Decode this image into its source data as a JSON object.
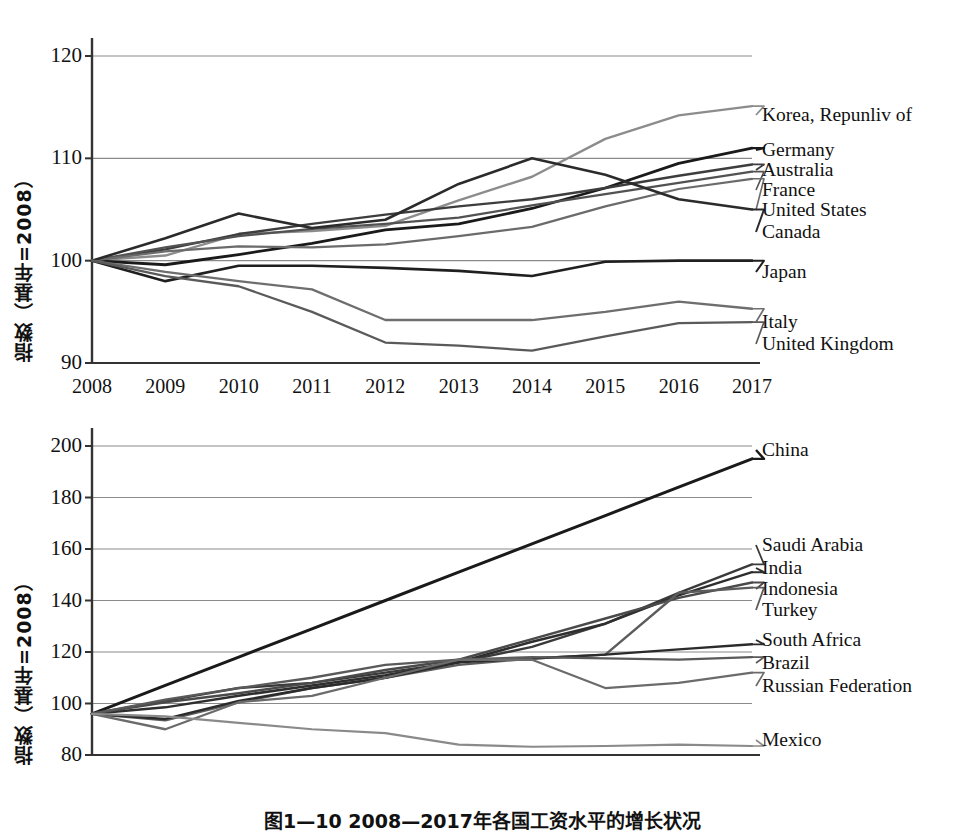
{
  "figure": {
    "caption": "图1—10  2008—2017年各国工资水平的增长状况"
  },
  "chart_data": [
    {
      "id": "advanced-economies",
      "type": "line",
      "title": "",
      "xlabel": "",
      "ylabel": "指数（基年=2008）",
      "x": [
        2008,
        2009,
        2010,
        2011,
        2012,
        2013,
        2014,
        2015,
        2016,
        2017
      ],
      "xlim": [
        2008,
        2017
      ],
      "ylim": [
        90,
        120
      ],
      "yticks": [
        90,
        100,
        110,
        120
      ],
      "xticks": [
        "2008",
        "2009",
        "2010",
        "2011",
        "2012",
        "2013",
        "2014",
        "2015",
        "2016",
        "2017"
      ],
      "grid": true,
      "legend_position": "right",
      "series": [
        {
          "name": "Korea,  Repunliv of",
          "color": "#8c8c8c",
          "width": 2.4,
          "values": [
            100.0,
            100.5,
            102.6,
            102.9,
            103.4,
            105.9,
            108.2,
            111.9,
            114.2,
            115.1
          ]
        },
        {
          "name": "Germany",
          "color": "#1a1a1a",
          "width": 2.8,
          "values": [
            100.0,
            99.6,
            100.6,
            101.7,
            103.0,
            103.6,
            105.1,
            107.1,
            109.5,
            111.0
          ]
        },
        {
          "name": "Australia",
          "color": "#3d3d3d",
          "width": 2.4,
          "values": [
            100.0,
            101.1,
            102.6,
            103.6,
            104.5,
            105.3,
            106.0,
            107.1,
            108.3,
            109.4
          ]
        },
        {
          "name": "France",
          "color": "#525252",
          "width": 2.2,
          "values": [
            100.0,
            101.3,
            102.4,
            103.1,
            103.6,
            104.2,
            105.4,
            106.5,
            107.6,
            108.7
          ]
        },
        {
          "name": "United States",
          "color": "#6b6b6b",
          "width": 2.2,
          "values": [
            100.0,
            100.9,
            101.4,
            101.3,
            101.6,
            102.4,
            103.3,
            105.3,
            107.0,
            108.0
          ]
        },
        {
          "name": "Canada",
          "color": "#2b2b2b",
          "width": 2.6,
          "values": [
            100.0,
            102.2,
            104.6,
            103.2,
            104.0,
            107.5,
            110.0,
            108.4,
            106.0,
            105.0
          ]
        },
        {
          "name": "Japan",
          "color": "#1f1f1f",
          "width": 2.6,
          "values": [
            100.0,
            98.0,
            99.5,
            99.5,
            99.3,
            99.0,
            98.5,
            99.9,
            100.0,
            100.0
          ]
        },
        {
          "name": "Italy",
          "color": "#6e6e6e",
          "width": 2.3,
          "values": [
            100.0,
            98.9,
            98.0,
            97.2,
            94.2,
            94.2,
            94.2,
            95.0,
            96.0,
            95.3
          ]
        },
        {
          "name": "United Kingdom",
          "color": "#5a5a5a",
          "width": 2.3,
          "values": [
            100.0,
            98.5,
            97.5,
            95.0,
            92.0,
            91.7,
            91.2,
            92.6,
            93.9,
            94.0
          ]
        }
      ],
      "legend_entries": [
        {
          "label": "Korea,  Repunliv of",
          "y_value": 115.1
        },
        {
          "label": "Germany",
          "y_value": 111.0
        },
        {
          "label": "Australia",
          "y_value": 109.4
        },
        {
          "label": "France",
          "y_value": 108.7
        },
        {
          "label": "United States",
          "y_value": 108.0
        },
        {
          "label": "Canada",
          "y_value": 105.0
        },
        {
          "label": "Japan",
          "y_value": 100.0
        },
        {
          "label": "Italy",
          "y_value": 95.3
        },
        {
          "label": "United Kingdom",
          "y_value": 94.0
        }
      ]
    },
    {
      "id": "emerging-economies",
      "type": "line",
      "title": "",
      "xlabel": "",
      "ylabel": "指数（基年=2008）",
      "x": [
        2008,
        2009,
        2010,
        2011,
        2012,
        2013,
        2014,
        2015,
        2016,
        2017
      ],
      "xlim": [
        2008,
        2017
      ],
      "ylim": [
        80,
        200
      ],
      "yticks": [
        80,
        100,
        120,
        140,
        160,
        180,
        200
      ],
      "xticks": [
        "2008",
        "2009",
        "2010",
        "2011",
        "2012",
        "2013",
        "2014",
        "2015",
        "2016",
        "2017"
      ],
      "grid": true,
      "legend_position": "right",
      "series": [
        {
          "name": "China",
          "color": "#1a1a1a",
          "width": 3.0,
          "values": [
            96.0,
            107.0,
            118.0,
            129.0,
            140.0,
            151.0,
            162.0,
            173.0,
            184.0,
            195.0
          ]
        },
        {
          "name": "Saudi Arabia",
          "color": "#3a3a3a",
          "width": 2.4,
          "values": [
            96.0,
            101.0,
            106.0,
            108.0,
            112.0,
            116.0,
            122.0,
            131.0,
            143.0,
            154.0
          ]
        },
        {
          "name": "India",
          "color": "#2e2e2e",
          "width": 2.5,
          "values": [
            96.0,
            98.5,
            103.0,
            107.0,
            111.0,
            116.0,
            124.0,
            131.0,
            142.0,
            151.0
          ]
        },
        {
          "name": "Indonesia",
          "color": "#4a4a4a",
          "width": 2.4,
          "values": [
            96.0,
            100.5,
            104.0,
            108.0,
            113.0,
            117.0,
            125.0,
            133.0,
            141.0,
            147.0
          ]
        },
        {
          "name": "Turkey",
          "color": "#5c5c5c",
          "width": 2.4,
          "values": [
            96.0,
            93.5,
            100.5,
            106.0,
            110.0,
            115.0,
            117.5,
            119.0,
            143.0,
            145.0
          ]
        },
        {
          "name": "South Africa",
          "color": "#2b2b2b",
          "width": 2.4,
          "values": [
            96.0,
            94.0,
            101.0,
            106.0,
            110.0,
            116.0,
            117.5,
            119.0,
            121.0,
            123.0
          ]
        },
        {
          "name": "Brazil",
          "color": "#5a5a5a",
          "width": 2.3,
          "values": [
            96.0,
            101.5,
            106.0,
            110.0,
            115.0,
            117.0,
            118.0,
            117.5,
            117.0,
            118.0
          ]
        },
        {
          "name": "Russian Federation",
          "color": "#6b6b6b",
          "width": 2.3,
          "values": [
            96.0,
            90.0,
            100.5,
            103.0,
            110.0,
            117.0,
            117.0,
            106.0,
            108.0,
            112.0
          ]
        },
        {
          "name": "Mexico",
          "color": "#8a8a8a",
          "width": 2.2,
          "values": [
            96.0,
            95.0,
            92.5,
            90.0,
            88.5,
            84.0,
            83.2,
            83.5,
            84.0,
            83.5
          ]
        }
      ],
      "legend_entries": [
        {
          "label": "China",
          "y_value": 195.0
        },
        {
          "label": "Saudi Arabia",
          "y_value": 154.0
        },
        {
          "label": "India",
          "y_value": 151.0
        },
        {
          "label": "Indonesia",
          "y_value": 147.0
        },
        {
          "label": "Turkey",
          "y_value": 145.0
        },
        {
          "label": "South Africa",
          "y_value": 123.0
        },
        {
          "label": "Brazil",
          "y_value": 118.0
        },
        {
          "label": "Russian Federation",
          "y_value": 112.0
        },
        {
          "label": "Mexico",
          "y_value": 83.5
        }
      ]
    }
  ]
}
